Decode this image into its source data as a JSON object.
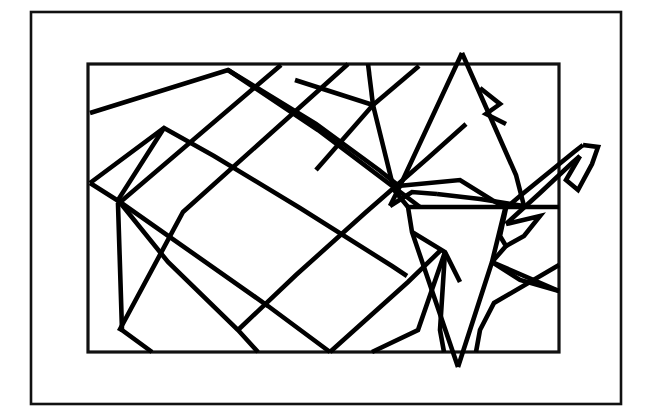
{
  "document": {
    "title": "Origami Crane Fold Pattern",
    "subject": "paper-crane-line-drawing",
    "alt_text": "Black line drawing of a folded paper crane inside a double rectangular frame"
  },
  "canvas": {
    "width": 648,
    "height": 419,
    "background_color": "#ffffff",
    "ink_color": "#000000",
    "frame_color": "#111111"
  },
  "frames": [
    {
      "name": "outer-frame",
      "x": 31,
      "y": 12,
      "width": 590,
      "height": 392,
      "stroke_width": 2.6
    },
    {
      "name": "inner-frame",
      "x": 88,
      "y": 64,
      "width": 471,
      "height": 288,
      "stroke_width": 3.2
    }
  ],
  "figure": {
    "name": "origami-crane",
    "stroke_width": 4.6,
    "peak_point": [
      462,
      53
    ],
    "tail_point": [
      458,
      367
    ],
    "beak_point": [
      586,
      143
    ],
    "polylines": [
      {
        "name": "wing-upper-ridge",
        "points": [
          [
            90,
            113
          ],
          [
            228,
            70
          ],
          [
            316,
            124
          ],
          [
            379,
            170
          ],
          [
            399,
            186
          ]
        ]
      },
      {
        "name": "wing-top-left-diagonal",
        "points": [
          [
            228,
            70
          ],
          [
            318,
            130
          ],
          [
            420,
            207
          ]
        ]
      },
      {
        "name": "wing-crease-long-a",
        "points": [
          [
            90,
            183
          ],
          [
            164,
            128
          ],
          [
            214,
            156
          ],
          [
            300,
            208
          ],
          [
            392,
            266
          ],
          [
            407,
            276
          ]
        ]
      },
      {
        "name": "wing-crease-long-b",
        "points": [
          [
            164,
            128
          ],
          [
            118,
            200
          ],
          [
            168,
            262
          ],
          [
            238,
            330
          ],
          [
            258,
            352
          ]
        ]
      },
      {
        "name": "wing-diagonal-down-1",
        "points": [
          [
            90,
            183
          ],
          [
            120,
            202
          ],
          [
            268,
            306
          ],
          [
            330,
            352
          ]
        ]
      },
      {
        "name": "wing-diagonal-down-2",
        "points": [
          [
            281,
            65
          ],
          [
            118,
            204
          ],
          [
            122,
            330
          ],
          [
            152,
            352
          ]
        ]
      },
      {
        "name": "wing-diagonal-down-3",
        "points": [
          [
            348,
            64
          ],
          [
            183,
            212
          ],
          [
            119,
            331
          ]
        ]
      },
      {
        "name": "wing-diagonal-up-1",
        "points": [
          [
            238,
            330
          ],
          [
            296,
            275
          ],
          [
            365,
            213
          ],
          [
            428,
            158
          ],
          [
            466,
            124
          ]
        ]
      },
      {
        "name": "wing-diagonal-up-2",
        "points": [
          [
            330,
            352
          ],
          [
            408,
            282
          ],
          [
            442,
            249
          ]
        ]
      },
      {
        "name": "hub-spoke-top",
        "points": [
          [
            373,
            105
          ],
          [
            368,
            64
          ]
        ]
      },
      {
        "name": "hub-spoke-left",
        "points": [
          [
            373,
            105
          ],
          [
            295,
            80
          ]
        ]
      },
      {
        "name": "hub-spoke-northeast",
        "points": [
          [
            373,
            105
          ],
          [
            419,
            66
          ]
        ]
      },
      {
        "name": "hub-spoke-southwest",
        "points": [
          [
            373,
            105
          ],
          [
            316,
            170
          ]
        ]
      },
      {
        "name": "hub-spoke-south",
        "points": [
          [
            373,
            105
          ],
          [
            394,
            190
          ],
          [
            408,
            207
          ]
        ]
      },
      {
        "name": "body-left-edge",
        "points": [
          [
            408,
            207
          ],
          [
            412,
            232
          ],
          [
            458,
            367
          ]
        ]
      },
      {
        "name": "body-right-edge",
        "points": [
          [
            458,
            367
          ],
          [
            492,
            262
          ],
          [
            505,
            209
          ]
        ]
      },
      {
        "name": "peak-left-slope",
        "points": [
          [
            462,
            53
          ],
          [
            400,
            186
          ],
          [
            390,
            206
          ]
        ]
      },
      {
        "name": "peak-right-slope",
        "points": [
          [
            462,
            53
          ],
          [
            516,
            175
          ],
          [
            524,
            206
          ]
        ]
      },
      {
        "name": "peak-base-left",
        "points": [
          [
            390,
            206
          ],
          [
            412,
            192
          ],
          [
            437,
            194
          ]
        ]
      },
      {
        "name": "peak-base-right",
        "points": [
          [
            437,
            194
          ],
          [
            480,
            199
          ],
          [
            524,
            206
          ]
        ]
      },
      {
        "name": "shoulder-horizontal",
        "points": [
          [
            408,
            207
          ],
          [
            559,
            207
          ]
        ]
      },
      {
        "name": "shoulder-fold-left",
        "points": [
          [
            398,
            186
          ],
          [
            460,
            180
          ],
          [
            492,
            200
          ],
          [
            506,
            208
          ]
        ]
      },
      {
        "name": "wing-notch-right",
        "points": [
          [
            480,
            88
          ],
          [
            500,
            104
          ],
          [
            486,
            114
          ],
          [
            506,
            124
          ]
        ]
      },
      {
        "name": "neck-lower-edge",
        "points": [
          [
            506,
            208
          ],
          [
            520,
            196
          ],
          [
            574,
            152
          ],
          [
            583,
            145
          ]
        ]
      },
      {
        "name": "neck-upper-edge",
        "points": [
          [
            506,
            224
          ],
          [
            540,
            193
          ],
          [
            572,
            163
          ],
          [
            580,
            156
          ]
        ]
      },
      {
        "name": "beak-top",
        "points": [
          [
            583,
            145
          ],
          [
            598,
            147
          ],
          [
            592,
            164
          ],
          [
            578,
            190
          ],
          [
            566,
            180
          ],
          [
            580,
            156
          ]
        ]
      },
      {
        "name": "neck-crease-inner",
        "points": [
          [
            506,
            224
          ],
          [
            540,
            216
          ],
          [
            524,
            236
          ],
          [
            506,
            246
          ]
        ]
      },
      {
        "name": "neck-base-crease",
        "points": [
          [
            506,
            208
          ],
          [
            500,
            236
          ],
          [
            506,
            246
          ],
          [
            492,
            262
          ]
        ]
      },
      {
        "name": "lower-right-x-a",
        "points": [
          [
            492,
            262
          ],
          [
            559,
            291
          ]
        ]
      },
      {
        "name": "lower-right-x-b",
        "points": [
          [
            559,
            265
          ],
          [
            494,
            303
          ],
          [
            480,
            330
          ],
          [
            476,
            352
          ]
        ]
      },
      {
        "name": "lower-right-fold",
        "points": [
          [
            492,
            262
          ],
          [
            520,
            280
          ],
          [
            559,
            291
          ]
        ]
      },
      {
        "name": "body-inner-crease",
        "points": [
          [
            412,
            232
          ],
          [
            445,
            252
          ],
          [
            460,
            282
          ]
        ]
      },
      {
        "name": "body-base-left",
        "points": [
          [
            372,
            352
          ],
          [
            418,
            330
          ],
          [
            445,
            252
          ]
        ]
      },
      {
        "name": "body-base-right",
        "points": [
          [
            445,
            252
          ],
          [
            440,
            330
          ],
          [
            444,
            352
          ]
        ]
      }
    ]
  }
}
